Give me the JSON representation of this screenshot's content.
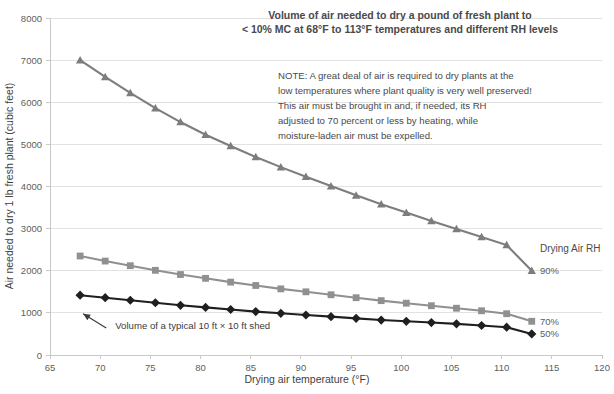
{
  "chart_data": {
    "type": "line",
    "title": "Volume of air needed to dry a pound of fresh plant to",
    "subtitle": "< 10% MC at 68°F to 113°F temperatures and different RH levels",
    "xlabel": "Drying air temperature (°F)",
    "ylabel": "Air needed to dry 1 lb fresh plant (cubic  feet)",
    "xlim": [
      65,
      120
    ],
    "ylim": [
      0,
      8000
    ],
    "xticks": [
      65,
      70,
      75,
      80,
      85,
      90,
      95,
      100,
      105,
      110,
      115,
      120
    ],
    "yticks": [
      0,
      1000,
      2000,
      3000,
      4000,
      5000,
      6000,
      7000,
      8000
    ],
    "grid": true,
    "legend_position": "right",
    "legend_title": "Drying Air RH",
    "x": [
      68,
      70.5,
      73,
      75.5,
      78,
      80.5,
      83,
      85.5,
      88,
      90.5,
      93,
      95.5,
      98,
      100.5,
      103,
      105.5,
      108,
      110.5,
      113
    ],
    "series": [
      {
        "name": "90%",
        "marker": "triangle",
        "color": "#7d7d7d",
        "values": [
          7000,
          6600,
          6220,
          5860,
          5530,
          5230,
          4960,
          4700,
          4460,
          4230,
          4010,
          3790,
          3580,
          3380,
          3180,
          2990,
          2800,
          2610,
          2000
        ]
      },
      {
        "name": "70%",
        "marker": "square",
        "color": "#909090",
        "values": [
          2350,
          2230,
          2120,
          2010,
          1910,
          1820,
          1730,
          1650,
          1570,
          1500,
          1430,
          1360,
          1290,
          1230,
          1170,
          1110,
          1050,
          980,
          800
        ]
      },
      {
        "name": "50%",
        "marker": "diamond",
        "color": "#1f1f1f",
        "values": [
          1420,
          1360,
          1300,
          1240,
          1180,
          1130,
          1080,
          1030,
          990,
          950,
          910,
          870,
          830,
          800,
          770,
          740,
          700,
          660,
          500
        ]
      }
    ],
    "annotations": [
      {
        "name": "shed-volume-annotation",
        "text": "Volume of a typical 10 ft × 10 ft shed",
        "x": 71.5,
        "y": 620,
        "arrow_from_x": 70.6,
        "arrow_from_y": 640,
        "arrow_to_x": 68.3,
        "arrow_to_y": 980
      }
    ]
  },
  "note": {
    "lines": [
      "NOTE: A great deal of air is required to dry plants at the",
      "low temperatures where plant quality is very well preserved!",
      "     This air must be brought in and, if needed, its RH",
      "adjusted to 70 percent or less by heating, while",
      "moisture-laden air must be expelled."
    ]
  },
  "colors": {
    "grid": "#e2e2e2",
    "axis": "#c9c9c9",
    "text": "#4a4a4a",
    "series_90": "#7d7d7d",
    "series_70": "#909090",
    "series_50": "#1f1f1f"
  }
}
